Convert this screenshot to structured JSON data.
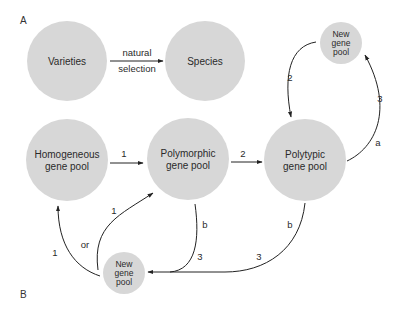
{
  "panels": {
    "a": {
      "label": "A"
    },
    "b": {
      "label": "B"
    }
  },
  "nodes": {
    "varieties": {
      "label": "Varieties"
    },
    "species": {
      "label": "Species"
    },
    "homogeneous": {
      "line1": "Homogeneous",
      "line2": "gene pool"
    },
    "polymorphic": {
      "line1": "Polymorphic",
      "line2": "gene pool"
    },
    "polytypic": {
      "line1": "Polytypic",
      "line2": "gene pool"
    },
    "new_top": {
      "line1": "New",
      "line2": "gene",
      "line3": "pool"
    },
    "new_bottom": {
      "line1": "New",
      "line2": "gene",
      "line3": "pool"
    }
  },
  "edges": {
    "varieties_species": {
      "line1": "natural",
      "line2": "selection"
    },
    "homog_poly": {
      "label": "1"
    },
    "poly_polytypic": {
      "label": "2"
    },
    "newtop_polytypic": {
      "label": "2"
    },
    "polytypic_newtop_a": {
      "label": "a"
    },
    "polytypic_newtop_3": {
      "label": "3"
    },
    "polymorphic_newbottom_b": {
      "label": "b"
    },
    "polymorphic_newbottom_3": {
      "label": "3"
    },
    "polytypic_newbottom_b": {
      "label": "b"
    },
    "polytypic_newbottom_3": {
      "label": "3"
    },
    "newbottom_homog": {
      "label": "1"
    },
    "newbottom_polymorphic": {
      "label": "1"
    },
    "or": {
      "label": "or"
    }
  }
}
